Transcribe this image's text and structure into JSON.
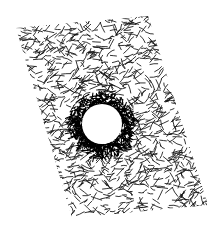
{
  "image": {
    "description": "Pen-and-ink drawing of a tilted rectangular sheet filled with dense scribbled hatching, with a round white hole near the center surrounded by a darker ring of hatching",
    "width": 224,
    "height": 232,
    "background_color": "#ffffff",
    "ink_color": "#111111",
    "sheet": {
      "shape": "parallelogram",
      "corners": [
        [
          16,
          28
        ],
        [
          148,
          16
        ],
        [
          208,
          205
        ],
        [
          72,
          218
        ]
      ],
      "texture": "dense short crosshatched pen strokes"
    },
    "hole": {
      "center": [
        102,
        124
      ],
      "radius": 20,
      "fill_color": "#ffffff",
      "ring_thickness": 13,
      "ring_color": "#000000"
    }
  }
}
